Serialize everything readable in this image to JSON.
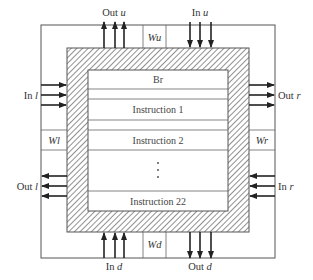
{
  "diagram": {
    "title": "",
    "ports": {
      "top_out": {
        "label_prefix": "Out",
        "label_var": "u",
        "direction": "up",
        "count": 3
      },
      "top_in": {
        "label_prefix": "In",
        "label_var": "u",
        "direction": "down",
        "count": 3
      },
      "left_in": {
        "label_prefix": "In",
        "label_var": "l",
        "direction": "right",
        "count": 3
      },
      "left_out": {
        "label_prefix": "Out",
        "label_var": "l",
        "direction": "left",
        "count": 3
      },
      "right_out": {
        "label_prefix": "Out",
        "label_var": "r",
        "direction": "right",
        "count": 3
      },
      "right_in": {
        "label_prefix": "In",
        "label_var": "r",
        "direction": "left",
        "count": 3
      },
      "bottom_in": {
        "label_prefix": "In",
        "label_var": "d",
        "direction": "up",
        "count": 3
      },
      "bottom_out": {
        "label_prefix": "Out",
        "label_var": "d",
        "direction": "down",
        "count": 3
      }
    },
    "registers": {
      "wu": {
        "prefix": "W",
        "var": "u"
      },
      "wd": {
        "prefix": "W",
        "var": "d"
      },
      "wl": {
        "prefix": "W",
        "var": "l"
      },
      "wr": {
        "prefix": "W",
        "var": "r"
      }
    },
    "memory_rows": [
      {
        "label": "Br"
      },
      {
        "label": "Instruction 1"
      },
      {
        "label": "Instruction 2"
      },
      {
        "label": "⋮"
      },
      {
        "label": "Instruction 22"
      }
    ]
  }
}
